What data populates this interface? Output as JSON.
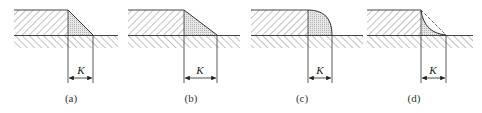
{
  "figure": {
    "panels": [
      {
        "id": "a",
        "caption": "(a)",
        "dimension_label": "K",
        "weld_shape": "flat-triangular"
      },
      {
        "id": "b",
        "caption": "(b)",
        "dimension_label": "K",
        "weld_shape": "long-leg-triangular"
      },
      {
        "id": "c",
        "caption": "(c)",
        "dimension_label": "K",
        "weld_shape": "convex"
      },
      {
        "id": "d",
        "caption": "(d)",
        "dimension_label": "K",
        "weld_shape": "concave"
      }
    ],
    "colors": {
      "line": "#333333",
      "hatch": "#666666",
      "weld_fill": "#d9d9d9"
    }
  }
}
